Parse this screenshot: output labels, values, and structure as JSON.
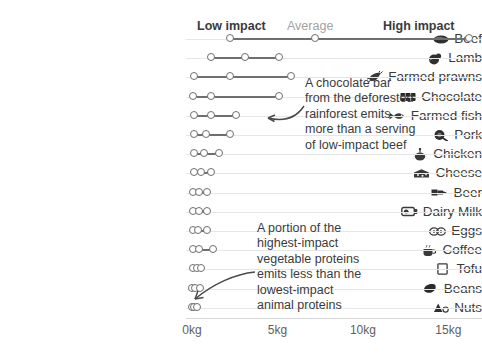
{
  "chart_data": {
    "type": "scatter",
    "title": "",
    "subtitle": "",
    "xlabel": "",
    "ylabel": "",
    "xlim": [
      0,
      16.5
    ],
    "xticks": [
      0,
      5,
      10,
      15
    ],
    "xticklabels": [
      "0kg",
      "5kg",
      "10kg",
      "15kg"
    ],
    "grid": true,
    "legend_position": "top",
    "legend": [
      {
        "label": "Low impact",
        "style": "bold",
        "color": "#3a3a3a"
      },
      {
        "label": "Average",
        "style": "normal",
        "color": "#a2a2a2"
      },
      {
        "label": "High impact",
        "style": "bold",
        "color": "#3a3a3a"
      }
    ],
    "series_names": [
      "Low impact",
      "Average",
      "High impact"
    ],
    "categories": [
      "Beef",
      "Lamb",
      "Farmed prawns",
      "Chocolate",
      "Farmed fish",
      "Pork",
      "Chicken",
      "Cheese",
      "Beer",
      "Dairy Milk",
      "Eggs",
      "Coffee",
      "Tofu",
      "Beans",
      "Nuts"
    ],
    "icons": [
      "beef-icon",
      "lamb-icon",
      "prawn-icon",
      "chocolate-icon",
      "fish-icon",
      "pork-icon",
      "chicken-icon",
      "cheese-icon",
      "beer-icon",
      "milk-icon",
      "eggs-icon",
      "coffee-icon",
      "tofu-icon",
      "beans-icon",
      "nuts-icon"
    ],
    "points": [
      {
        "category": "Beef",
        "low": 2.2,
        "average": 7.2,
        "high": 16.2
      },
      {
        "category": "Lamb",
        "low": 1.1,
        "average": 3.1,
        "high": 5.1
      },
      {
        "category": "Farmed prawns",
        "low": 0.1,
        "average": 2.2,
        "high": 5.8
      },
      {
        "category": "Chocolate",
        "low": 0.05,
        "average": 1.1,
        "high": 5.1
      },
      {
        "category": "Farmed fish",
        "low": 0.1,
        "average": 1.1,
        "high": 2.6
      },
      {
        "category": "Pork",
        "low": 0.1,
        "average": 0.8,
        "high": 2.2
      },
      {
        "category": "Chicken",
        "low": 0.1,
        "average": 0.7,
        "high": 1.6
      },
      {
        "category": "Cheese",
        "low": 0.1,
        "average": 0.5,
        "high": 1.1
      },
      {
        "category": "Beer",
        "low": 0.05,
        "average": 0.4,
        "high": 0.9
      },
      {
        "category": "Dairy Milk",
        "low": 0.05,
        "average": 0.4,
        "high": 0.9
      },
      {
        "category": "Eggs",
        "low": 0.05,
        "average": 0.35,
        "high": 0.85
      },
      {
        "category": "Coffee",
        "low": 0.05,
        "average": 0.4,
        "high": 1.25
      },
      {
        "category": "Tofu",
        "low": 0.05,
        "average": 0.3,
        "high": 0.55
      },
      {
        "category": "Beans",
        "low": 0.02,
        "average": 0.2,
        "high": 0.45
      },
      {
        "category": "Nuts",
        "low": 0.02,
        "average": 0.12,
        "high": 0.3
      }
    ],
    "annotations": [
      {
        "name": "chocolate-annotation",
        "text": "A chocolate bar\nfrom the deforested\nrainforest emits\nmore than a serving\nof low-impact beef"
      },
      {
        "name": "vegetable-protein-annotation",
        "text": "A portion of the\nhighest-impact\nvegetable proteins\nemits less than the\nlowest-impact\nanimal proteins"
      }
    ],
    "colors": {
      "marker_stroke": "#6f6f6f",
      "connector": "#6f6f6f",
      "gridline": "#e6e6e6",
      "axis_line": "#d8d8d8",
      "text": "#3b3b3b",
      "muted_text": "#a2a2a2"
    }
  }
}
